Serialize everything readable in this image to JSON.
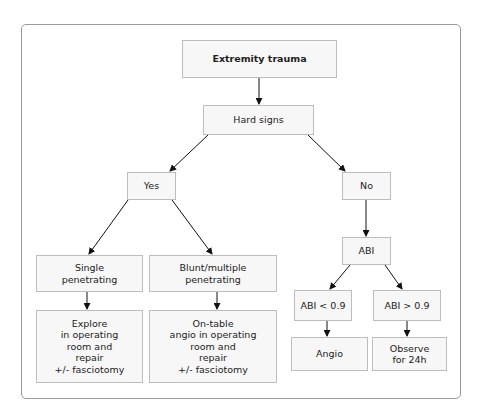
{
  "diagram": {
    "type": "flowchart",
    "nodes": {
      "extremity_trauma": "Extremity trauma",
      "hard_signs": "Hard signs",
      "yes": "Yes",
      "no": "No",
      "single_penetrating": "Single\npenetrating",
      "blunt_multiple": "Blunt/multiple\npenetrating",
      "explore": "Explore\nin operating\nroom and\nrepair\n+/- fasciotomy",
      "on_table": "On-table\nangio in operating\nroom and\nrepair\n+/- fasciotomy",
      "abi": "ABI",
      "abi_low": "ABI < 0.9",
      "abi_high": "ABI > 0.9",
      "angio": "Angio",
      "observe": "Observe\nfor 24h"
    },
    "edges": [
      [
        "Extremity trauma",
        "Hard signs"
      ],
      [
        "Hard signs",
        "Yes"
      ],
      [
        "Hard signs",
        "No"
      ],
      [
        "Yes",
        "Single penetrating"
      ],
      [
        "Yes",
        "Blunt/multiple penetrating"
      ],
      [
        "Single penetrating",
        "Explore in operating room and repair +/- fasciotomy"
      ],
      [
        "Blunt/multiple penetrating",
        "On-table angio in operating room and repair +/- fasciotomy"
      ],
      [
        "No",
        "ABI"
      ],
      [
        "ABI",
        "ABI < 0.9"
      ],
      [
        "ABI",
        "ABI > 0.9"
      ],
      [
        "ABI < 0.9",
        "Angio"
      ],
      [
        "ABI > 0.9",
        "Observe for 24h"
      ]
    ]
  }
}
